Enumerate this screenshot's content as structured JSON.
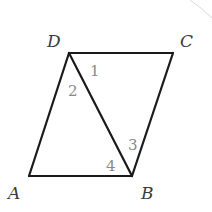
{
  "figure": {
    "vertices": {
      "A": {
        "label": "A",
        "x": 29,
        "y": 176
      },
      "B": {
        "label": "B",
        "x": 132,
        "y": 176
      },
      "C": {
        "label": "C",
        "x": 173,
        "y": 53
      },
      "D": {
        "label": "D",
        "x": 69,
        "y": 53
      }
    },
    "segments": [
      "AB",
      "BC",
      "CD",
      "DA",
      "BD"
    ],
    "angles": [
      {
        "label": "1",
        "vertex": "D",
        "between": "DC, DB"
      },
      {
        "label": "2",
        "vertex": "D",
        "between": "DA, DB"
      },
      {
        "label": "3",
        "vertex": "B",
        "between": "BC, BD"
      },
      {
        "label": "4",
        "vertex": "B",
        "between": "BA, BD"
      }
    ],
    "colors": {
      "line": "#1a1a1a",
      "vertex_label": "#3a3a3a",
      "angle_label": "#8a8a8a",
      "background": "#ffffff"
    }
  }
}
